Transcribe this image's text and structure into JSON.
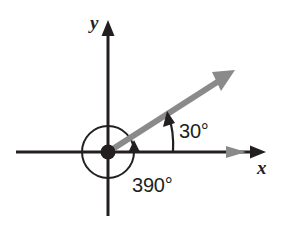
{
  "figure": {
    "type": "diagram",
    "background_color": "#ffffff",
    "axes": {
      "x_label": "x",
      "y_label": "y",
      "axis_color": "#231f20",
      "origin_px": [
        108,
        152
      ],
      "x_axis_span_px": [
        16,
        266
      ],
      "y_axis_span_px": [
        20,
        216
      ]
    },
    "origin_dot": {
      "name": "origin-point",
      "color": "#231f20",
      "radius_px": 7
    },
    "terminal_ray": {
      "name": "terminal-side-ray",
      "color": "#8a8a8a",
      "angle_degrees": 33,
      "from_px": [
        108,
        152
      ],
      "to_px": [
        233,
        72
      ]
    },
    "angle_arcs": [
      {
        "name": "angle-arc-30",
        "label": "30°",
        "value": 30,
        "unit": "degrees",
        "color": "#231f20",
        "direction": "counterclockwise"
      },
      {
        "name": "angle-arc-390",
        "label": "390°",
        "value": 390,
        "unit": "degrees",
        "color": "#231f20",
        "direction": "counterclockwise",
        "full_revolution_radius_px": 26
      }
    ],
    "labels": {
      "x": "x",
      "y": "y",
      "angle_small": "30°",
      "angle_large": "390°"
    }
  }
}
